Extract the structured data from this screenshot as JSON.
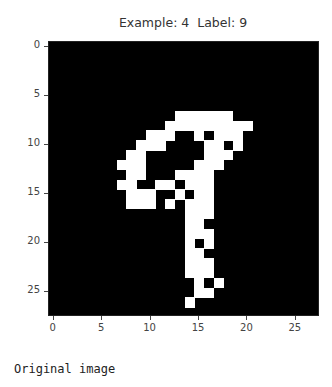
{
  "title": "Example: 4  Label: 9",
  "caption": "Original image",
  "chart_data": {
    "type": "heatmap",
    "title": "Example: 4  Label: 9",
    "xlabel": "",
    "ylabel": "",
    "colormap": "gray",
    "shape": [
      28,
      28
    ],
    "xticks": [
      0,
      5,
      10,
      15,
      20,
      25
    ],
    "yticks": [
      0,
      5,
      10,
      15,
      20,
      25
    ],
    "xlim": [
      -0.5,
      27.5
    ],
    "ylim": [
      27.5,
      -0.5
    ],
    "grid": false,
    "white_pixels_by_row": {
      "7": [
        13,
        14,
        15,
        16,
        17,
        18
      ],
      "8": [
        12,
        13,
        14,
        15,
        16,
        17,
        18,
        19,
        20
      ],
      "9": [
        10,
        11,
        12,
        15,
        17,
        18,
        19
      ],
      "10": [
        9,
        10,
        11,
        16,
        17,
        19
      ],
      "11": [
        8,
        9,
        16,
        17,
        18
      ],
      "12": [
        7,
        8,
        9,
        15,
        16,
        17
      ],
      "13": [
        8,
        9,
        13,
        14,
        15,
        16
      ],
      "14": [
        7,
        8,
        11,
        12,
        14,
        15,
        16
      ],
      "15": [
        8,
        9,
        10,
        13,
        15,
        16
      ],
      "16": [
        8,
        9,
        10,
        12,
        14,
        15,
        16
      ],
      "17": [
        14,
        15,
        16
      ],
      "18": [
        14,
        15
      ],
      "19": [
        14,
        15,
        16
      ],
      "20": [
        14,
        16
      ],
      "21": [
        14,
        15
      ],
      "22": [
        14,
        15,
        16
      ],
      "23": [
        14,
        15,
        16
      ],
      "24": [
        15,
        17
      ],
      "25": [
        15,
        16
      ],
      "26": [
        14
      ]
    }
  },
  "ticks": {
    "x": [
      "0",
      "5",
      "10",
      "15",
      "20",
      "25"
    ],
    "y": [
      "0",
      "5",
      "10",
      "15",
      "20",
      "25"
    ]
  }
}
